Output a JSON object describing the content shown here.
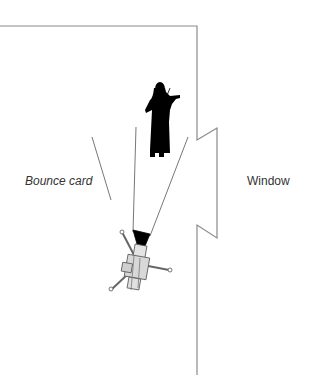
{
  "labels": {
    "bounce_card": "Bounce card",
    "window": "Window"
  },
  "colors": {
    "wall": "#8a8a8a",
    "lines": "#777777",
    "subject": "#000000",
    "camera_fill": "#d8d8d8",
    "camera_stroke": "#555555",
    "text": "#333333"
  },
  "elements": [
    {
      "type": "wall",
      "description": "room wall outline"
    },
    {
      "type": "window",
      "description": "window opening in right wall"
    },
    {
      "type": "subject",
      "description": "violinist silhouette"
    },
    {
      "type": "bounce-card",
      "description": "bounce card reflector line"
    },
    {
      "type": "camera",
      "description": "camera on tripod with lens angle lines"
    }
  ]
}
